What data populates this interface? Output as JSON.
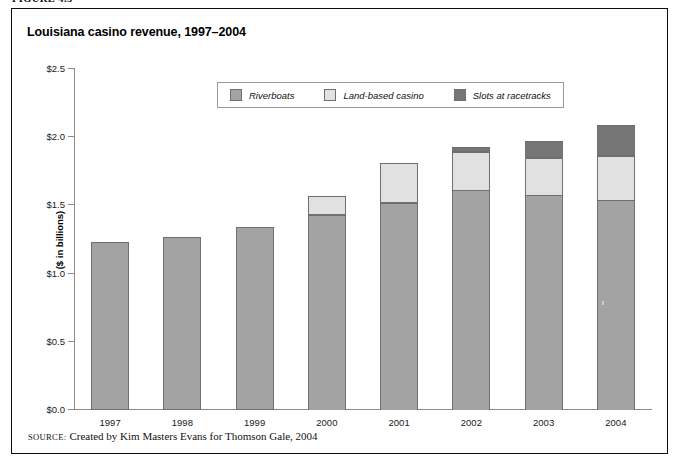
{
  "figure": {
    "caption": "FIGURE 4.5",
    "title": "Louisiana casino revenue, 1997–2004",
    "source_label": "SOURCE:",
    "source_text": "Created by Kim Masters Evans for Thomson Gale, 2004"
  },
  "legend": {
    "items": [
      {
        "label": "Riverboats",
        "color": "#a3a3a3",
        "key": "riverboats"
      },
      {
        "label": "Land-based casino",
        "color": "#e1e1e1",
        "key": "land_based"
      },
      {
        "label": "Slots at racetracks",
        "color": "#767676",
        "key": "slots"
      }
    ]
  },
  "chart_data": {
    "type": "bar",
    "stacked": true,
    "title": "Louisiana casino revenue, 1997–2004",
    "xlabel": "",
    "ylabel": "($ in billions)",
    "ylim": [
      0.0,
      2.5
    ],
    "ytick_values": [
      0.0,
      0.5,
      1.0,
      1.5,
      2.0,
      2.5
    ],
    "ytick_labels": [
      "$0.0",
      "$0.5",
      "$1.0",
      "$1.5",
      "$2.0",
      "$2.5"
    ],
    "grid": false,
    "legend_position": "top-center",
    "categories": [
      "1997",
      "1998",
      "1999",
      "2000",
      "2001",
      "2002",
      "2003",
      "2004"
    ],
    "series": [
      {
        "name": "Riverboats",
        "color": "#a3a3a3",
        "values": [
          1.23,
          1.27,
          1.34,
          1.43,
          1.52,
          1.61,
          1.58,
          1.54
        ]
      },
      {
        "name": "Land-based casino",
        "color": "#e1e1e1",
        "values": [
          0.0,
          0.0,
          0.0,
          0.14,
          0.29,
          0.28,
          0.27,
          0.32
        ]
      },
      {
        "name": "Slots at racetracks",
        "color": "#767676",
        "values": [
          0.0,
          0.0,
          0.0,
          0.0,
          0.0,
          0.04,
          0.12,
          0.23
        ]
      }
    ],
    "totals": [
      1.23,
      1.27,
      1.34,
      1.57,
      1.81,
      1.93,
      1.97,
      2.09
    ]
  }
}
